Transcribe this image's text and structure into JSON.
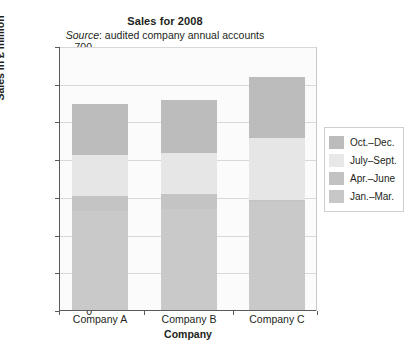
{
  "chart_data": {
    "type": "bar",
    "subtype": "stacked-bar",
    "title": "Sales for 2008",
    "subtitle_italic": "Source",
    "subtitle_rest": ": audited company annual accounts",
    "subtitle_full": "Source: audited company annual accounts",
    "xlabel": "Company",
    "ylabel": "Sales in £ million",
    "categories": [
      "Company A",
      "Company B",
      "Company C"
    ],
    "ylim": [
      0,
      700
    ],
    "yticks": [
      0,
      100,
      200,
      300,
      400,
      500,
      600,
      700
    ],
    "ytick_labels": [
      "0",
      "100",
      "200",
      "300",
      "400",
      "500",
      "600",
      "700"
    ],
    "grid": "horizontal",
    "legend_position": "right",
    "stack_order_bottom_to_top": [
      "Jan.–Mar.",
      "Apr.–June",
      "July–Sept.",
      "Oct.–Dec."
    ],
    "series": [
      {
        "name": "Oct.–Dec.",
        "color": "#bcbcbc",
        "values": [
          135,
          140,
          160
        ],
        "cumulative_top": [
          550,
          560,
          620
        ]
      },
      {
        "name": "July–Sept.",
        "color": "#e6e6e6",
        "values": [
          110,
          110,
          165
        ],
        "cumulative_top": [
          415,
          420,
          460
        ]
      },
      {
        "name": "Apr.–June",
        "color": "#c4c4c4",
        "values": [
          40,
          40,
          5
        ],
        "cumulative_top": [
          305,
          310,
          295
        ]
      },
      {
        "name": "Jan.–Mar.",
        "color": "#c9c9c9",
        "values": [
          265,
          270,
          290
        ],
        "cumulative_top": [
          265,
          270,
          290
        ]
      }
    ],
    "totals": [
      550,
      560,
      620
    ]
  },
  "legend": {
    "items": [
      {
        "label": "Oct.–Dec.",
        "color": "#bcbcbc"
      },
      {
        "label": "July–Sept.",
        "color": "#e8e8e8"
      },
      {
        "label": "Apr.–June",
        "color": "#c2c2c2"
      },
      {
        "label": "Jan.–Mar.",
        "color": "#c7c7c7"
      }
    ]
  },
  "colors": {
    "axis": "#5a5a5a",
    "grid": "#d8d8d8",
    "plot_background": "#fbfbfb",
    "text": "#231f20",
    "legend_border": "#cfcfcf"
  }
}
